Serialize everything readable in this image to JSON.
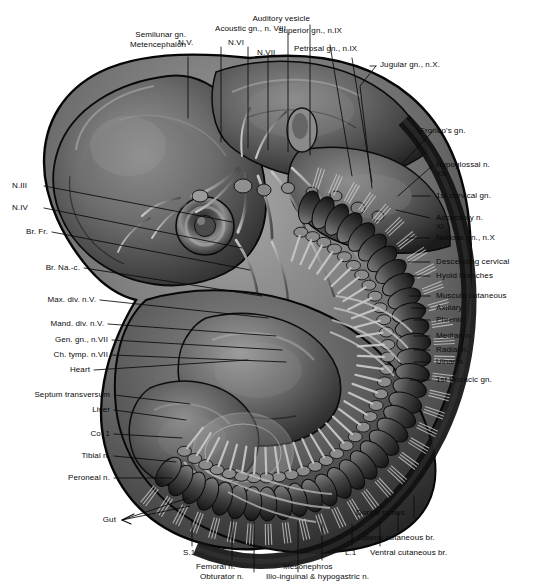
{
  "figure": {
    "kind": "anatomical-illustration",
    "background_color": "#ffffff",
    "ink_color": "#0a0a0a"
  },
  "labels": {
    "top_left": [
      {
        "id": "semilunar-gn",
        "text": "Semilunar gn."
      },
      {
        "id": "metencephalon",
        "text": "Metencephalon"
      },
      {
        "id": "acoustic-gn-n8",
        "text": "Acoustic gn., n. VIII"
      },
      {
        "id": "auditory-vesicle",
        "text": "Auditory vesicle"
      },
      {
        "id": "n-5",
        "text": "N.V."
      },
      {
        "id": "n-6",
        "text": "N.VI"
      },
      {
        "id": "n-7",
        "text": "N.VII"
      }
    ],
    "top_right": [
      {
        "id": "superior-gn-n9",
        "text": "Superior gn., n.IX"
      },
      {
        "id": "petrosal-gn-n9",
        "text": "Petrosal gn., n.IX"
      },
      {
        "id": "jugular-gn-n10",
        "text": "Jugular gn., n.X."
      }
    ],
    "right": [
      {
        "id": "froriep-gn",
        "text": "Froriep's gn."
      },
      {
        "id": "hypoglossal-n",
        "text": "Hypoglossal n."
      },
      {
        "id": "hypoglossal-n-numeral",
        "text": "XII"
      },
      {
        "id": "first-cervical-gn",
        "text": "1st cervical gn."
      },
      {
        "id": "accessory-n",
        "text": "Accessory n."
      },
      {
        "id": "accessory-n-numeral",
        "text": "XI"
      },
      {
        "id": "nodose-gn-n10",
        "text": "Nodose gn., n.X"
      },
      {
        "id": "descending-cervical",
        "text": "Descending cervical"
      },
      {
        "id": "hyoid-branches",
        "text": "Hyoid branches"
      },
      {
        "id": "musculo-cutaneous",
        "text": "Musculo cutaneous"
      },
      {
        "id": "axillary",
        "text": "Axillary"
      },
      {
        "id": "phrenic",
        "text": "Phrenic"
      },
      {
        "id": "median-n",
        "text": "Median n."
      },
      {
        "id": "radial-n",
        "text": "Radial n."
      },
      {
        "id": "ulnar-n",
        "text": "Ulnar n."
      },
      {
        "id": "first-thoracic-gn",
        "text": "1st thoracic gn."
      }
    ],
    "left": [
      {
        "id": "n-3",
        "text": "N.III"
      },
      {
        "id": "n-4",
        "text": "N.IV"
      },
      {
        "id": "br-fr",
        "text": "Br. Fr."
      },
      {
        "id": "br-na-c",
        "text": "Br. Na.-c."
      },
      {
        "id": "max-div-n5",
        "text": "Max. div. n.V."
      },
      {
        "id": "mand-div-n5",
        "text": "Mand. div. n.V."
      },
      {
        "id": "gen-gn-n7",
        "text": "Gen. gn., n.VII"
      },
      {
        "id": "ch-tymp-n7",
        "text": "Ch. tymp. n.VII"
      },
      {
        "id": "heart",
        "text": "Heart"
      },
      {
        "id": "septum-transversum",
        "text": "Septum transversum"
      },
      {
        "id": "liver",
        "text": "Liver"
      },
      {
        "id": "co-1",
        "text": "Co. 1"
      },
      {
        "id": "tibial-n",
        "text": "Tibial n."
      },
      {
        "id": "peroneal-n",
        "text": "Peroneal n."
      },
      {
        "id": "gut",
        "text": "Gut"
      }
    ],
    "bottom": [
      {
        "id": "s-1",
        "text": "S.1"
      },
      {
        "id": "femoral-n",
        "text": "Femoral n."
      },
      {
        "id": "obturator-n",
        "text": "Obturator n."
      },
      {
        "id": "ilio-inguinal-hypogastric-n",
        "text": "Ilio-inguinal & hypogastric n."
      },
      {
        "id": "mesonephros",
        "text": "Mesonephros"
      },
      {
        "id": "l-1",
        "text": "L.1"
      },
      {
        "id": "ventral-cutaneous-br",
        "text": "Ventral cutaneous br."
      },
      {
        "id": "lateral-cutaneous-br",
        "text": "Lateral cutaneous br."
      },
      {
        "id": "dorsal-ramus",
        "text": "Dorsal ramus"
      }
    ]
  }
}
